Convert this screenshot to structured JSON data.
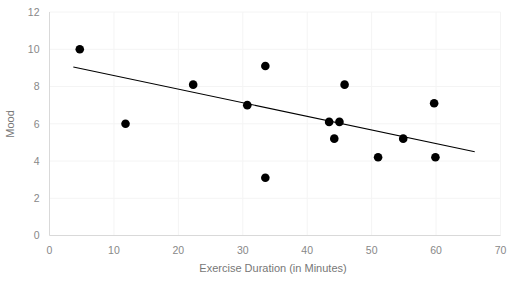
{
  "chart_data": {
    "type": "scatter",
    "title": "",
    "xlabel": "Exercise Duration (in Minutes)",
    "ylabel": "Mood",
    "xlim": [
      0,
      70
    ],
    "ylim": [
      0,
      12
    ],
    "xticks": [
      0,
      10,
      20,
      30,
      40,
      50,
      60,
      70
    ],
    "yticks": [
      0,
      2,
      4,
      6,
      8,
      10,
      12
    ],
    "grid": true,
    "legend": "none",
    "marker_color": "#000000",
    "trendline_color": "#000000",
    "gridline_color": "#f4f4f4",
    "axis_color": "#d9d9d9",
    "tick_label_color": "#888888",
    "axis_title_color": "#777777",
    "points": [
      {
        "x": 4.7,
        "y": 10.0
      },
      {
        "x": 11.8,
        "y": 6.0
      },
      {
        "x": 22.3,
        "y": 8.1
      },
      {
        "x": 30.7,
        "y": 7.0
      },
      {
        "x": 33.5,
        "y": 9.1
      },
      {
        "x": 33.5,
        "y": 3.1
      },
      {
        "x": 43.4,
        "y": 6.1
      },
      {
        "x": 45.0,
        "y": 6.1
      },
      {
        "x": 44.2,
        "y": 5.2
      },
      {
        "x": 45.8,
        "y": 8.1
      },
      {
        "x": 51.0,
        "y": 4.2
      },
      {
        "x": 54.9,
        "y": 5.2
      },
      {
        "x": 59.7,
        "y": 7.1
      },
      {
        "x": 59.9,
        "y": 4.2
      }
    ],
    "trendline": {
      "x_start": 3.7,
      "y_start": 9.05,
      "x_end": 66.0,
      "y_end": 4.5
    }
  },
  "axis": {
    "x_tick_labels": [
      "0",
      "10",
      "20",
      "30",
      "40",
      "50",
      "60",
      "70"
    ],
    "y_tick_labels": [
      "0",
      "2",
      "4",
      "6",
      "8",
      "10",
      "12"
    ],
    "x_title": "Exercise Duration (in Minutes)",
    "y_title": "Mood"
  }
}
